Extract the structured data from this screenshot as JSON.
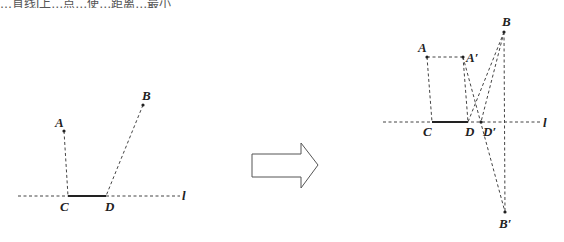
{
  "top_text": "…直线l上…点…使…距离…最小",
  "left_figure": {
    "line_label": "l",
    "points": {
      "A": {
        "label": "A",
        "x": 64,
        "y": 131
      },
      "B": {
        "label": "B",
        "x": 143,
        "y": 105
      },
      "C": {
        "label": "C",
        "x": 68,
        "y": 196
      },
      "D": {
        "label": "D",
        "x": 106,
        "y": 196
      }
    }
  },
  "arrow": {
    "direction": "right",
    "meaning": "transforms-to"
  },
  "right_figure": {
    "line_label": "l",
    "points": {
      "A": {
        "label": "A",
        "x": 427,
        "y": 57
      },
      "A_prime": {
        "label": "A′",
        "x": 463,
        "y": 57
      },
      "B": {
        "label": "B",
        "x": 504,
        "y": 32
      },
      "B_prime": {
        "label": "B′",
        "x": 505,
        "y": 212
      },
      "C": {
        "label": "C",
        "x": 432,
        "y": 122
      },
      "D": {
        "label": "D",
        "x": 468,
        "y": 122
      },
      "D_prime": {
        "label": "D′",
        "x": 481,
        "y": 122
      }
    }
  }
}
